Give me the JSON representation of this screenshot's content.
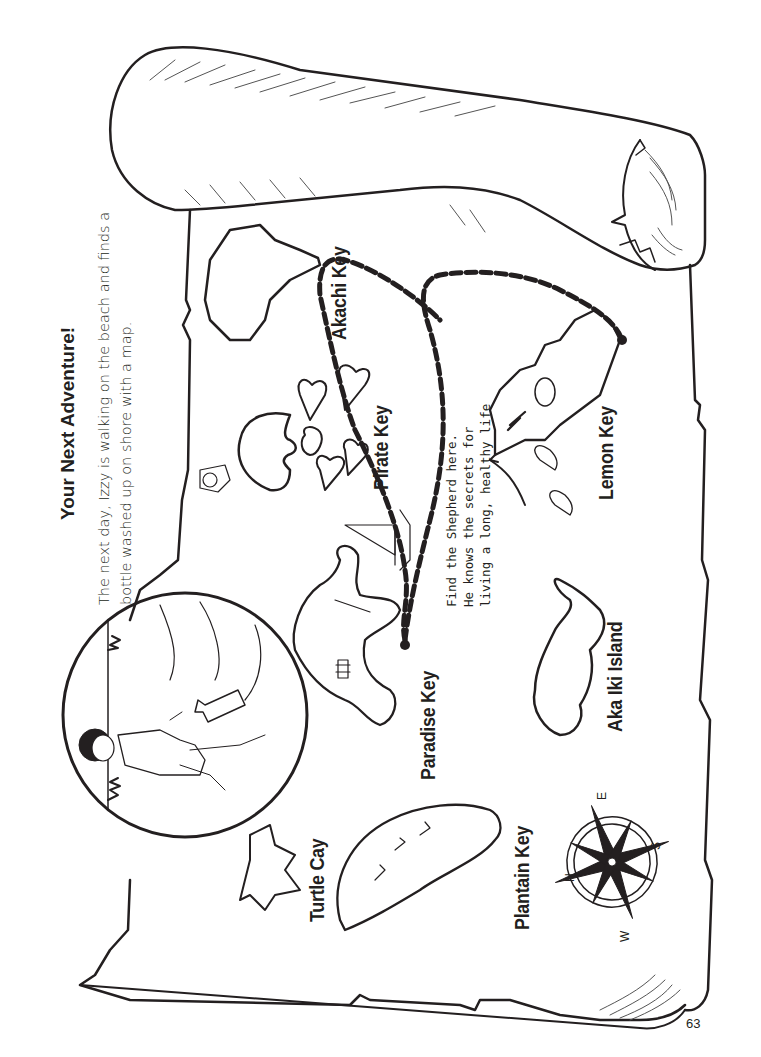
{
  "page": {
    "title": "Your Next Adventure!",
    "intro_line1": "The next day, Izzy is walking on the beach and finds a",
    "intro_line2": "bottle washed up on shore with a map.",
    "page_number": "63"
  },
  "map": {
    "islands": [
      {
        "id": "akachi",
        "label": "Akachi Key"
      },
      {
        "id": "pirate",
        "label": "Pirate Key"
      },
      {
        "id": "paradise",
        "label": "Paradise Key"
      },
      {
        "id": "turtle",
        "label": "Turtle Cay"
      },
      {
        "id": "plantain",
        "label": "Plantain Key"
      },
      {
        "id": "aka-iki",
        "label": "Aka Iki Island"
      },
      {
        "id": "lemon",
        "label": "Lemon Key"
      }
    ],
    "note_line1": "Find the Shepherd here.",
    "note_line2": "He knows the secrets for",
    "note_line3": "living a long, healthy life",
    "compass": {
      "n": "N",
      "e": "E",
      "s": "S",
      "w": "W"
    }
  },
  "colors": {
    "ink": "#231f20",
    "paper": "#ffffff"
  }
}
